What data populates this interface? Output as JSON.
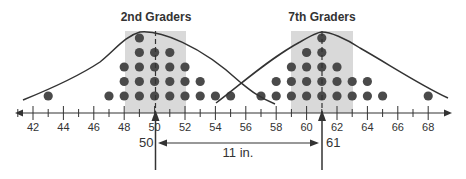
{
  "chart_data": {
    "type": "scatter",
    "subtype": "dot-plot",
    "title": "",
    "xlabel": "",
    "ylabel": "",
    "xlim": [
      41,
      69
    ],
    "grid": false,
    "legend": null,
    "ticks": [
      42,
      44,
      46,
      48,
      50,
      52,
      54,
      56,
      58,
      60,
      62,
      64,
      66,
      68
    ],
    "tick_labels": [
      "42",
      "44",
      "46",
      "48",
      "50",
      "52",
      "54",
      "56",
      "58",
      "60",
      "62",
      "64",
      "66",
      "68"
    ],
    "series": [
      {
        "name": "2nd Graders",
        "counts": {
          "43": 1,
          "47": 1,
          "48": 3,
          "49": 5,
          "50": 4,
          "51": 4,
          "52": 3,
          "53": 2,
          "54": 1
        },
        "mean": 50,
        "mean_label": "50",
        "shaded_range": [
          48,
          52
        ]
      },
      {
        "name": "7th Graders",
        "counts": {
          "55": 1,
          "57": 1,
          "58": 2,
          "59": 3,
          "60": 4,
          "61": 5,
          "62": 3,
          "63": 2,
          "64": 2,
          "65": 1,
          "68": 1
        },
        "mean": 61,
        "mean_label": "61",
        "shaded_range": [
          59,
          63
        ]
      }
    ],
    "annotations": [
      {
        "type": "double-arrow",
        "from": 50,
        "to": 61,
        "label": "11 in."
      }
    ]
  },
  "labels": {
    "group1_title": "2nd Graders",
    "group2_title": "7th Graders",
    "mean1": "50",
    "mean2": "61",
    "difference": "11 in."
  },
  "colors": {
    "dot": "#4a4a4a",
    "shade": "#d9d9d9",
    "line": "#333333"
  }
}
